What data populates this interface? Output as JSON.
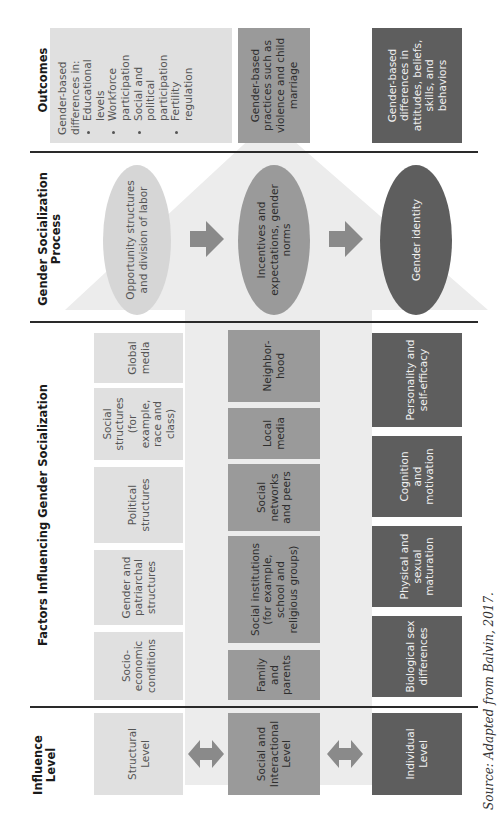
{
  "headers": {
    "influence_level": "Influence Level",
    "factors": "Factors Influencing Gender Socialization",
    "process": "Gender Socialization Process",
    "outcomes": "Outcomes"
  },
  "influence_levels": [
    {
      "label": "Structural Level",
      "shade": "light"
    },
    {
      "label": "Social and Interactional Level",
      "shade": "mid"
    },
    {
      "label": "Individual Level",
      "shade": "dark"
    }
  ],
  "factors": {
    "structural": [
      "Socio-economic conditions",
      "Gender and patriarchal structures",
      "Political structures",
      "Social structures (for example, race and class)",
      "Global media"
    ],
    "social_interactional": [
      "Family and parents",
      "Social institutions (for example, school and religious groups)",
      "Social networks and peers",
      "Local media",
      "Neighbor-hood"
    ],
    "individual": [
      "Biological sex differences",
      "Physical and sexual maturation",
      "Cognition and motivation",
      "Personality and self-efficacy"
    ]
  },
  "process": [
    {
      "label": "Opportunity structures and division of labor",
      "shade": "light"
    },
    {
      "label": "Incentives and expectations, gender norms",
      "shade": "mid"
    },
    {
      "label": "Gender identity",
      "shade": "dark"
    }
  ],
  "outcomes": {
    "structural": {
      "intro": "Gender-based differences in:",
      "bullets": [
        "Educational levels",
        "Workforce participation",
        "Social and political participation",
        "Fertility regulation"
      ]
    },
    "social_interactional": "Gender-based practices such as violence and child marriage",
    "individual": "Gender-based differences in attitudes, beliefs, skills, and behaviors"
  },
  "source": "Source: Adapted from Balvin, 2017.",
  "colors": {
    "light": "#e0e0e0",
    "mid": "#9a9a9a",
    "dark": "#5e5e5e",
    "background_arrow": "#ececec",
    "connector_arrow": "#8a8a8a"
  }
}
